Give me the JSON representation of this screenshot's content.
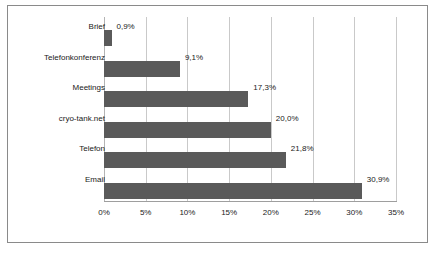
{
  "chart_data": {
    "type": "bar",
    "orientation": "horizontal",
    "title": "",
    "subtitle": "",
    "xlabel": "",
    "ylabel": "",
    "grid": true,
    "legend": false,
    "xlim": [
      0,
      35
    ],
    "xticks": [
      "0%",
      "5%",
      "10%",
      "15%",
      "20%",
      "25%",
      "30%",
      "35%"
    ],
    "xtick_values": [
      0,
      5,
      10,
      15,
      20,
      25,
      30,
      35
    ],
    "categories": [
      "Brief",
      "Telefonkonferenz",
      "Meetings",
      "cryo-tank.net",
      "Telefon",
      "Email"
    ],
    "values": [
      0.9,
      9.1,
      17.3,
      20.0,
      21.8,
      30.9
    ],
    "data_labels": [
      "0,9%",
      "9,1%",
      "17,3%",
      "20,0%",
      "21,8%",
      "30,9%"
    ],
    "bar_color": "#5a5a5a",
    "grid_color": "#c9c9c9",
    "border_color": "#8a8a8a",
    "text_color": "#1a1a1a"
  }
}
